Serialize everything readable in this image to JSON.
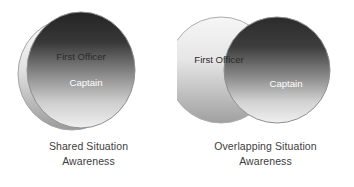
{
  "figure": {
    "background_color": "#ffffff",
    "panels": [
      {
        "id": "shared",
        "caption_line_1": "Shared Situation",
        "caption_line_2": "Awareness",
        "diagram_type": "two-coincident-circles",
        "circles": [
          {
            "role": "first-officer",
            "label": "First Officer",
            "label_color": "#2b2b2b",
            "fill_top": "#fbfbfb",
            "fill_bottom": "#9a9a9a",
            "stroke": "#9d9d9d"
          },
          {
            "role": "captain",
            "label": "Captain",
            "label_color": "#ffffff",
            "fill_top": "#2c2c2c",
            "fill_bottom": "#e8e8e8",
            "stroke": "#8c8c8c"
          }
        ]
      },
      {
        "id": "overlapping",
        "caption_line_1": "Overlapping Situation",
        "caption_line_2": "Awareness",
        "diagram_type": "two-overlapping-circles",
        "circles": [
          {
            "role": "first-officer",
            "label": "First Officer",
            "label_color": "#2b2b2b",
            "fill_top": "#f4f4f4",
            "fill_bottom": "#a2a2a2",
            "stroke": "#a8a8a8"
          },
          {
            "role": "captain",
            "label": "Captain",
            "label_color": "#ffffff",
            "fill_top": "#2e2e2e",
            "fill_bottom": "#ededed",
            "stroke": "#8c8c8c"
          }
        ]
      }
    ]
  }
}
